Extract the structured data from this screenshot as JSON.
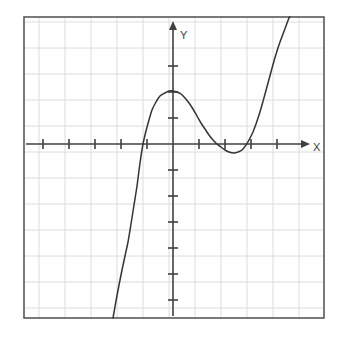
{
  "figure": {
    "title": "",
    "background_color": "#ffffff",
    "width": 346,
    "height": 339
  },
  "plot_frame": {
    "name": "plot-border",
    "left": 24,
    "top": 17,
    "right": 324,
    "bottom": 318,
    "border_color": "#595959",
    "border_width": 1.6
  },
  "grid": {
    "visible": true,
    "color": "#dcdcdc",
    "spacing_px": 26,
    "line_width": 1,
    "vertical_lines_px": [
      39,
      65,
      91,
      117,
      143,
      169,
      195,
      221,
      247,
      273,
      299
    ],
    "horizontal_lines_px": [
      22,
      48,
      74,
      100,
      126,
      152,
      178,
      204,
      230,
      256,
      282,
      308
    ]
  },
  "axes": {
    "color": "#404040",
    "line_width": 1.6,
    "x_axis": {
      "name": "x-axis",
      "label": "X",
      "axis_y_px": 144,
      "start_x_px": 26,
      "arrow_tip_x_px": 306,
      "label_x_px": 313,
      "label_y_px": 148,
      "tick_half_len_px": 5,
      "tick_positions_px": [
        43,
        69,
        95,
        121,
        147,
        199,
        225,
        251,
        277
      ]
    },
    "y_axis": {
      "name": "y-axis",
      "label": "Y",
      "axis_x_px": 173,
      "start_y_px": 316,
      "arrow_tip_y_px": 25,
      "label_x_px": 180,
      "label_y_px": 36,
      "tick_half_len_px": 5,
      "tick_positions_px": [
        66,
        92,
        118,
        170,
        196,
        222,
        248,
        274,
        300
      ]
    },
    "origin_px": {
      "x": 173,
      "y": 144
    },
    "unit_px": 26
  },
  "chart_data": {
    "type": "line",
    "title": "",
    "xlabel": "X",
    "ylabel": "Y",
    "grid": true,
    "legend": false,
    "xlim": [
      -5.73,
      5.81
    ],
    "ylim": [
      -6.69,
      4.88
    ],
    "xticks": [
      -5,
      -4,
      -3,
      -2,
      -1,
      1,
      2,
      3,
      4
    ],
    "yticks": [
      3,
      2,
      1,
      -1,
      -2,
      -3,
      -4,
      -5,
      -6
    ],
    "curve": {
      "name": "cubic-curve",
      "color": "#333333",
      "line_width": 1.5,
      "roots_x": [
        -1.15,
        1.85,
        2.85
      ],
      "local_maximum": {
        "x": 0.0,
        "y": 2.0
      },
      "local_minimum": {
        "x": 2.35,
        "y": -0.3
      },
      "y_intercept": 2.0,
      "points_px": [
        [
          113,
          318
        ],
        [
          116,
          301
        ],
        [
          119,
          285
        ],
        [
          122,
          270
        ],
        [
          125,
          256
        ],
        [
          128,
          242
        ],
        [
          131,
          224
        ],
        [
          134,
          205
        ],
        [
          137,
          186
        ],
        [
          140,
          163
        ],
        [
          143,
          144
        ],
        [
          146,
          131
        ],
        [
          149,
          120
        ],
        [
          152,
          110
        ],
        [
          156,
          102
        ],
        [
          160,
          96
        ],
        [
          165,
          93
        ],
        [
          169,
          91
        ],
        [
          173,
          91
        ],
        [
          177,
          92
        ],
        [
          181,
          94
        ],
        [
          185,
          98
        ],
        [
          189,
          103
        ],
        [
          193,
          109
        ],
        [
          197,
          116
        ],
        [
          201,
          123
        ],
        [
          205,
          129
        ],
        [
          209,
          135
        ],
        [
          213,
          140
        ],
        [
          217,
          144
        ],
        [
          221,
          147
        ],
        [
          225,
          150
        ],
        [
          229,
          152
        ],
        [
          234,
          153
        ],
        [
          238,
          152
        ],
        [
          242,
          150
        ],
        [
          246,
          145
        ],
        [
          249,
          140
        ],
        [
          253,
          132
        ],
        [
          256,
          124
        ],
        [
          259,
          115
        ],
        [
          262,
          105
        ],
        [
          265,
          94
        ],
        [
          268,
          83
        ],
        [
          271,
          72
        ],
        [
          274,
          61
        ],
        [
          277,
          51
        ],
        [
          280,
          42
        ],
        [
          283,
          34
        ],
        [
          286,
          26
        ],
        [
          289,
          18
        ],
        [
          290,
          17
        ]
      ]
    }
  }
}
